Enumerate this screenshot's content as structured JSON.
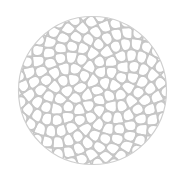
{
  "image": {
    "subject": "circular phyllotaxis cellular pattern",
    "width": 183,
    "height": 187,
    "background": "#ffffff",
    "circle": {
      "cx": 92.5,
      "cy": 90.5,
      "r": 74
    },
    "cell_count": 170,
    "line_color": "#c6c6c6",
    "line_width": 1.8,
    "outline_color": "#cfcfcf",
    "outline_width": 1.2
  }
}
